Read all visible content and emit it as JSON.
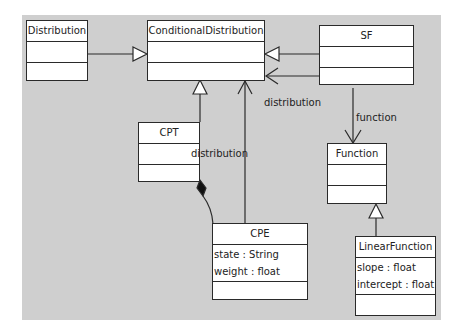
{
  "diagram": {
    "type": "uml-class-diagram",
    "classes": [
      {
        "id": "distribution",
        "name": "Distribution",
        "attributes": []
      },
      {
        "id": "conditional",
        "name": "ConditionalDistribution",
        "attributes": []
      },
      {
        "id": "sf",
        "name": "SF",
        "attributes": []
      },
      {
        "id": "cpt",
        "name": "CPT",
        "attributes": []
      },
      {
        "id": "function",
        "name": "Function",
        "attributes": []
      },
      {
        "id": "cpe",
        "name": "CPE",
        "attributes": [
          "state : String",
          "weight : float"
        ]
      },
      {
        "id": "linear",
        "name": "LinearFunction",
        "attributes": [
          "slope : float",
          "intercept : float"
        ]
      }
    ],
    "relations": [
      {
        "type": "generalization",
        "from": "Distribution",
        "to": "ConditionalDistribution"
      },
      {
        "type": "generalization",
        "from": "SF",
        "to": "ConditionalDistribution"
      },
      {
        "type": "association",
        "from": "SF",
        "to": "ConditionalDistribution",
        "label": "distribution"
      },
      {
        "type": "association",
        "from": "SF",
        "to": "Function",
        "label": "function"
      },
      {
        "type": "generalization",
        "from": "CPT",
        "to": "ConditionalDistribution"
      },
      {
        "type": "association",
        "from": "CPE",
        "to": "ConditionalDistribution",
        "label": "distribution"
      },
      {
        "type": "composition",
        "from": "CPT",
        "to": "CPE"
      },
      {
        "type": "generalization",
        "from": "LinearFunction",
        "to": "Function"
      }
    ],
    "labels": {
      "sf_distribution": "distribution",
      "sf_function": "function",
      "cpe_distribution": "distribution"
    }
  }
}
